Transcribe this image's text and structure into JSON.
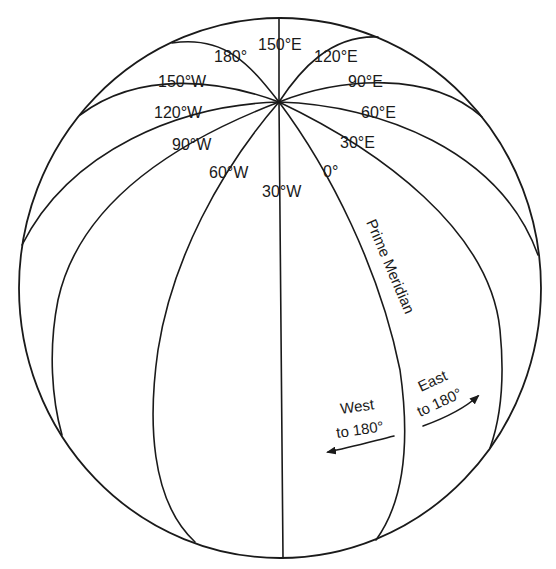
{
  "diagram": {
    "meridian_labels": {
      "m_150e": "150°E",
      "m_180": "180°",
      "m_120e": "120°E",
      "m_150w": "150°W",
      "m_90e": "90°E",
      "m_120w": "120°W",
      "m_60e": "60°E",
      "m_90w": "90°W",
      "m_30e": "30°E",
      "m_60w": "60°W",
      "m_0": "0°",
      "m_30w": "30°W"
    },
    "prime_meridian_label": "Prime Meridian",
    "west_arrow": {
      "line1": "West",
      "line2": "to 180°"
    },
    "east_arrow": {
      "line1": "East",
      "line2": "to 180°"
    },
    "colors": {
      "ink": "#1a1a1a",
      "background": "#ffffff"
    }
  }
}
